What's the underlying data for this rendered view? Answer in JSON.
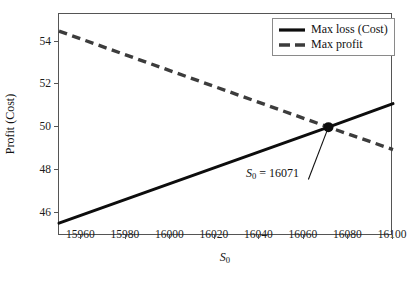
{
  "chart_data": {
    "type": "line",
    "title": "",
    "xlabel": "S_0",
    "xlabel_plain": "S0",
    "ylabel": "Profit (Cost)",
    "xlim": [
      15950,
      16100
    ],
    "ylim": [
      44.9,
      55.3
    ],
    "xticks": [
      15960,
      15980,
      16000,
      16020,
      16040,
      16060,
      16080,
      16100
    ],
    "yticks": [
      46,
      48,
      50,
      52,
      54
    ],
    "grid": false,
    "legend_position": "upper right",
    "series": [
      {
        "name": "Max loss (Cost)",
        "style": "solid",
        "color": "#0d0d0d",
        "x": [
          15950,
          16071,
          16100
        ],
        "values": [
          45.5,
          50.0,
          51.1
        ]
      },
      {
        "name": "Max profit",
        "style": "dashed",
        "color": "#3c3c3c",
        "x": [
          15950,
          16071,
          16100
        ],
        "values": [
          54.5,
          50.0,
          48.95
        ]
      }
    ],
    "markers": [
      {
        "name": "intersection",
        "x": 16071,
        "y": 50.0,
        "shape": "circle",
        "color": "#0d0d0d"
      }
    ],
    "annotations": [
      {
        "label_var": "S",
        "label_sub": "0",
        "label_eq": " = 16071",
        "label_plain": "S0 = 16071",
        "point_x": 16071,
        "point_y": 50.0,
        "text_x": 16062,
        "text_y": 47.55
      }
    ]
  },
  "legend": {
    "entries": [
      {
        "label": "Max loss (Cost)",
        "style": "solid",
        "color": "#0d0d0d"
      },
      {
        "label": "Max profit",
        "style": "dashed",
        "color": "#3c3c3c"
      }
    ]
  },
  "axis": {
    "x_tick_labels": [
      "15960",
      "15980",
      "16000",
      "16020",
      "16040",
      "16060",
      "16080",
      "16100"
    ],
    "y_tick_labels": [
      "46",
      "48",
      "50",
      "52",
      "54"
    ],
    "x_title_var": "S",
    "x_title_sub": "0",
    "y_title": "Profit (Cost)"
  },
  "caption": {
    "text": ""
  },
  "colors": {
    "frame": "#555555",
    "series_solid": "#0d0d0d",
    "series_dashed": "#3c3c3c",
    "background": "#ffffff"
  }
}
